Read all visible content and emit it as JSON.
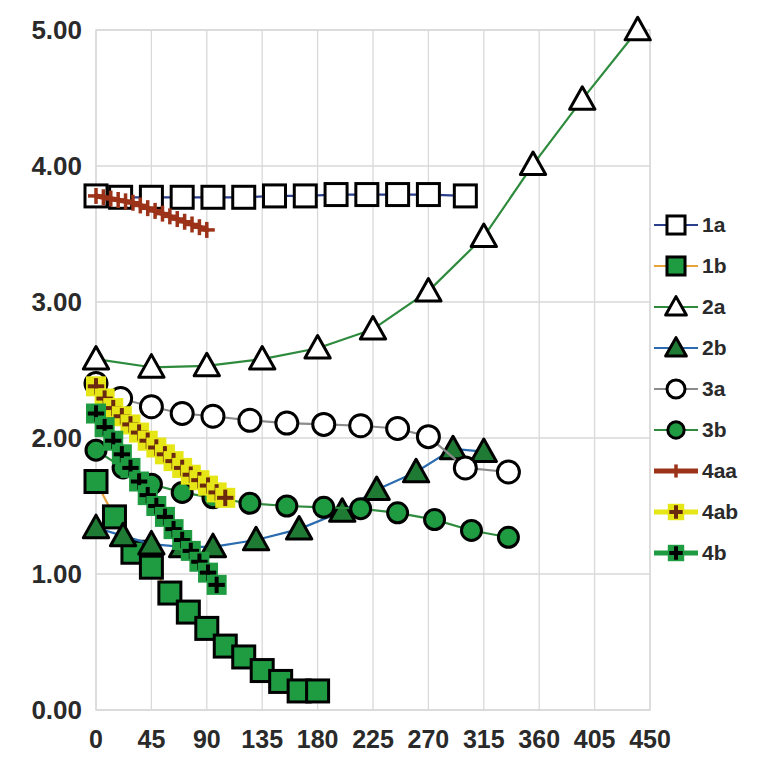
{
  "chart_data": {
    "type": "line",
    "title": "",
    "xlabel": "",
    "ylabel": "",
    "xlim": [
      0,
      450
    ],
    "ylim": [
      0,
      5
    ],
    "xticks": [
      0,
      45,
      90,
      135,
      180,
      225,
      270,
      315,
      360,
      405,
      450
    ],
    "xtick_labels": [
      "0",
      "45",
      "90",
      "135",
      "180",
      "225",
      "270",
      "315",
      "360",
      "405",
      "450"
    ],
    "yticks": [
      0,
      1,
      2,
      3,
      4,
      5
    ],
    "ytick_labels": [
      "0.00",
      "1.00",
      "2.00",
      "3.00",
      "4.00",
      "5.00"
    ],
    "grid": true,
    "grid_axis": "both",
    "legend_position": "right",
    "series": [
      {
        "name": "1a",
        "color": "#2b3f8c",
        "marker": "square-open",
        "marker_color": "#000000",
        "marker_fill": "#ffffff",
        "x": [
          0,
          20,
          45,
          70,
          95,
          120,
          145,
          170,
          195,
          220,
          245,
          270,
          300
        ],
        "y": [
          3.78,
          3.77,
          3.77,
          3.77,
          3.77,
          3.77,
          3.78,
          3.78,
          3.79,
          3.79,
          3.79,
          3.79,
          3.78
        ]
      },
      {
        "name": "1b",
        "color": "#e8a33d",
        "marker": "square-filled",
        "marker_color": "#000000",
        "marker_fill": "#1f9b42",
        "x": [
          0,
          15,
          30,
          45,
          60,
          75,
          90,
          105,
          120,
          135,
          150,
          165,
          180
        ],
        "y": [
          1.68,
          1.42,
          1.16,
          1.05,
          0.86,
          0.72,
          0.6,
          0.47,
          0.39,
          0.29,
          0.21,
          0.14,
          0.14
        ]
      },
      {
        "name": "2a",
        "color": "#2e8b3d",
        "marker": "triangle-open",
        "marker_color": "#000000",
        "marker_fill": "#ffffff",
        "x": [
          0,
          45,
          90,
          135,
          180,
          225,
          270,
          315,
          355,
          395,
          440
        ],
        "y": [
          2.58,
          2.52,
          2.53,
          2.58,
          2.66,
          2.8,
          3.08,
          3.48,
          4.01,
          4.49,
          5.0
        ]
      },
      {
        "name": "2b",
        "color": "#2b6cb0",
        "marker": "triangle-filled",
        "marker_color": "#000000",
        "marker_fill": "#1f7a34",
        "x": [
          0,
          22,
          45,
          70,
          95,
          130,
          165,
          200,
          228,
          260,
          290,
          315
        ],
        "y": [
          1.34,
          1.28,
          1.22,
          1.2,
          1.2,
          1.25,
          1.33,
          1.46,
          1.62,
          1.75,
          1.92,
          1.9
        ]
      },
      {
        "name": "3a",
        "color": "#8c8c8c",
        "marker": "circle-open",
        "marker_color": "#000000",
        "marker_fill": "#ffffff",
        "x": [
          0,
          20,
          45,
          70,
          95,
          125,
          155,
          185,
          215,
          245,
          270,
          300,
          335
        ],
        "y": [
          2.4,
          2.29,
          2.23,
          2.18,
          2.16,
          2.13,
          2.11,
          2.1,
          2.09,
          2.07,
          2.01,
          1.78,
          1.75
        ]
      },
      {
        "name": "3b",
        "color": "#2e8b3d",
        "marker": "circle-filled",
        "marker_color": "#000000",
        "marker_fill": "#1f9b42",
        "x": [
          0,
          22,
          45,
          70,
          95,
          125,
          155,
          185,
          215,
          245,
          275,
          305,
          335
        ],
        "y": [
          1.91,
          1.78,
          1.66,
          1.6,
          1.56,
          1.52,
          1.5,
          1.49,
          1.48,
          1.45,
          1.4,
          1.32,
          1.27
        ]
      },
      {
        "name": "4aa",
        "color": "#9c3318",
        "marker": "plus",
        "marker_color": "#9c3318",
        "marker_fill": "none",
        "x": [
          0,
          6,
          12,
          18,
          24,
          30,
          36,
          42,
          48,
          54,
          60,
          66,
          72,
          78,
          84,
          90
        ],
        "y": [
          3.78,
          3.77,
          3.76,
          3.75,
          3.74,
          3.73,
          3.71,
          3.69,
          3.67,
          3.65,
          3.63,
          3.61,
          3.59,
          3.57,
          3.55,
          3.53
        ]
      },
      {
        "name": "4ab",
        "color": "#e6e617",
        "marker": "plus-on-square",
        "marker_color": "#6b2a10",
        "marker_fill": "#e6e617",
        "x": [
          0,
          7,
          14,
          21,
          28,
          35,
          42,
          49,
          56,
          63,
          70,
          77,
          84,
          91,
          98,
          105
        ],
        "y": [
          2.38,
          2.29,
          2.22,
          2.16,
          2.1,
          2.04,
          1.98,
          1.93,
          1.88,
          1.83,
          1.78,
          1.73,
          1.69,
          1.65,
          1.6,
          1.56
        ]
      },
      {
        "name": "4b",
        "color": "#1f9b42",
        "marker": "plus-on-square",
        "marker_color": "#000000",
        "marker_fill": "#1f9b42",
        "x": [
          0,
          7,
          14,
          21,
          28,
          35,
          42,
          49,
          56,
          63,
          70,
          77,
          84,
          91,
          98
        ],
        "y": [
          2.18,
          2.08,
          1.98,
          1.88,
          1.78,
          1.68,
          1.58,
          1.5,
          1.42,
          1.33,
          1.25,
          1.17,
          1.09,
          1.01,
          0.92
        ]
      }
    ]
  },
  "legend": {
    "entries": [
      {
        "label": "1a"
      },
      {
        "label": "1b"
      },
      {
        "label": "2a"
      },
      {
        "label": "2b"
      },
      {
        "label": "3a"
      },
      {
        "label": "3b"
      },
      {
        "label": "4aa"
      },
      {
        "label": "4ab"
      },
      {
        "label": "4b"
      }
    ]
  }
}
